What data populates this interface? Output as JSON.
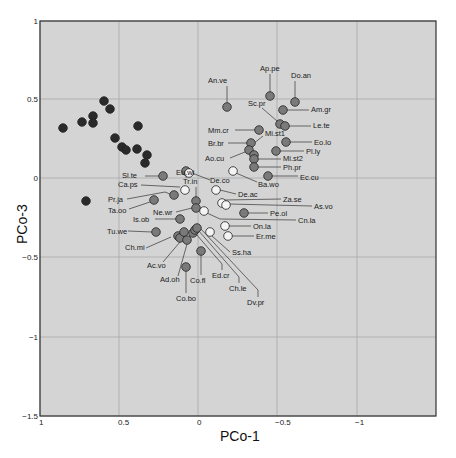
{
  "chart_data": {
    "type": "scatter",
    "title": "",
    "xlabel": "PCo-1",
    "ylabel": "PCo-3",
    "xlim": [
      1,
      -1.5
    ],
    "ylim": [
      -1.5,
      1
    ],
    "x_reversed": true,
    "grid": true,
    "x_ticks": [
      "1",
      "0.5",
      "0",
      "-0.5",
      "-1"
    ],
    "y_ticks": [
      "1",
      "0.5",
      "0",
      "-0.5",
      "-1",
      "-1.5"
    ],
    "colors": {
      "dark": "#2a2a2a",
      "mid": "#7a7a7a",
      "white": "#f4f4f4",
      "plot_bg": "#d4d4d4",
      "grid": "#a8a8a8"
    },
    "series": [
      {
        "name": "dark group",
        "color": "dark",
        "points": [
          {
            "x": 0.85,
            "y": 0.33
          },
          {
            "x": 0.73,
            "y": 0.36
          },
          {
            "x": 0.66,
            "y": 0.4
          },
          {
            "x": 0.66,
            "y": 0.36
          },
          {
            "x": 0.59,
            "y": 0.5
          },
          {
            "x": 0.55,
            "y": 0.45
          },
          {
            "x": 0.52,
            "y": 0.26
          },
          {
            "x": 0.48,
            "y": 0.2
          },
          {
            "x": 0.45,
            "y": 0.18
          },
          {
            "x": 0.38,
            "y": 0.34
          },
          {
            "x": 0.38,
            "y": 0.19
          },
          {
            "x": 0.32,
            "y": 0.15
          },
          {
            "x": 0.33,
            "y": 0.1
          },
          {
            "x": 0.71,
            "y": -0.14
          }
        ]
      },
      {
        "name": "labelled mid",
        "color": "mid",
        "points": [
          {
            "x": -0.18,
            "y": 0.45,
            "label": "An.ve"
          },
          {
            "x": -0.45,
            "y": 0.53,
            "label": "Ap.pe"
          },
          {
            "x": -0.6,
            "y": 0.48,
            "label": "Do.an"
          },
          {
            "x": -0.53,
            "y": 0.43,
            "label": "Am.gr"
          },
          {
            "x": -0.49,
            "y": 0.34,
            "label": "Sc.pr"
          },
          {
            "x": -0.53,
            "y": 0.33,
            "label": "Le.te"
          },
          {
            "x": -0.32,
            "y": 0.31,
            "label": "Mm.cr"
          },
          {
            "x": -0.38,
            "y": 0.27,
            "label": "Mi.st1"
          },
          {
            "x": -0.56,
            "y": 0.24,
            "label": "Eo.lo"
          },
          {
            "x": -0.36,
            "y": 0.22,
            "label": "Br.br"
          },
          {
            "x": -0.35,
            "y": 0.19,
            "label": "Ao.cu"
          },
          {
            "x": -0.49,
            "y": 0.17,
            "label": "Pl.ly"
          },
          {
            "x": -0.38,
            "y": 0.14,
            "label": "Mi.st2"
          },
          {
            "x": -0.38,
            "y": 0.1,
            "label": "Ph.pr"
          },
          {
            "x": -0.45,
            "y": 0.01,
            "label": "Ec.cu"
          },
          {
            "x": 0.11,
            "y": 0.05,
            "label": "Eu.wi"
          },
          {
            "x": 0.22,
            "y": -0.01,
            "label": "Sl.te"
          },
          {
            "x": 0.24,
            "y": -0.12,
            "label": "Pr.ja"
          },
          {
            "x": 0.37,
            "y": -0.17,
            "label": "Ta.oo"
          },
          {
            "x": 0.02,
            "y": -0.19,
            "label": "Tr.in"
          },
          {
            "x": 0.03,
            "y": -0.23,
            "label": "Ne.wr"
          },
          {
            "x": 0.11,
            "y": -0.28,
            "label": "Is.ob"
          },
          {
            "x": 0.27,
            "y": -0.36,
            "label": "Tu.we"
          },
          {
            "x": 0.07,
            "y": -0.31,
            "label": "Ch.mi"
          },
          {
            "x": 0.13,
            "y": -0.35,
            "label": "Ac.vo"
          },
          {
            "x": 0.09,
            "y": -0.38,
            "label": "Ad.oh"
          },
          {
            "x": -0.02,
            "y": -0.42,
            "label": "Co.fl"
          },
          {
            "x": 0.08,
            "y": -0.55,
            "label": "Co.bo"
          },
          {
            "x": -0.29,
            "y": -0.23,
            "label": "Pe.ol"
          },
          {
            "x": 0.13,
            "y": -0.32,
            "label": ""
          },
          {
            "x": 0.1,
            "y": -0.32,
            "label": ""
          },
          {
            "x": 0.05,
            "y": -0.3,
            "label": ""
          },
          {
            "x": 0.08,
            "y": -0.3,
            "label": ""
          },
          {
            "x": 0.03,
            "y": -0.29,
            "label": ""
          }
        ]
      },
      {
        "name": "labelled white",
        "color": "white",
        "points": [
          {
            "x": 0.08,
            "y": -0.04,
            "label": "Ca.ps"
          },
          {
            "x": -0.03,
            "y": 0.04,
            "label": "De.co"
          },
          {
            "x": -0.11,
            "y": -0.08,
            "label": "De.ac"
          },
          {
            "x": -0.2,
            "y": -0.17,
            "label": "Za.se"
          },
          {
            "x": -0.24,
            "y": -0.19,
            "label": "As.vo"
          },
          {
            "x": -0.01,
            "y": -0.21,
            "label": "Cn.la"
          },
          {
            "x": -0.18,
            "y": -0.32,
            "label": "On.la"
          },
          {
            "x": -0.2,
            "y": -0.38,
            "label": "Er.me"
          },
          {
            "x": -0.12,
            "y": -0.32,
            "label": "Ss.ha"
          },
          {
            "x": 0.03,
            "y": -0.37,
            "label": "Ed.cr"
          },
          {
            "x": 0.01,
            "y": -0.37,
            "label": "Ch.le"
          },
          {
            "x": -0.02,
            "y": -0.36,
            "label": "Dv.pr"
          },
          {
            "x": -0.23,
            "y": 0.04,
            "label": "Ba.wo"
          }
        ]
      }
    ]
  },
  "axes": {
    "x_label": "PCo-1",
    "y_label": "PCo-3",
    "x_ticks": [
      "1",
      "0.5",
      "0",
      "-0.5",
      "-1"
    ],
    "y_ticks": [
      "1",
      "0.5",
      "0",
      "-0.5",
      "-1",
      "-1.5"
    ]
  },
  "labels": [
    {
      "text": "An.ve",
      "tx": 208,
      "ty": 83,
      "px": 227,
      "py": 107,
      "path": "M227,103 L227,86"
    },
    {
      "text": "Ap.pe",
      "tx": 260,
      "ty": 71,
      "px": 270,
      "py": 96,
      "path": "M270,92 L270,74"
    },
    {
      "text": "Do.an",
      "tx": 291,
      "ty": 78,
      "px": 295,
      "py": 102,
      "path": "M295,98 L295,81"
    },
    {
      "text": "Am.gr",
      "tx": 311,
      "ty": 112,
      "px": 283,
      "py": 110,
      "path": "M287,110 L309,110"
    },
    {
      "text": "Sc.pr",
      "tx": 248,
      "ty": 106,
      "px": 280,
      "py": 124,
      "path": "M262,108 L277,121"
    },
    {
      "text": "Le.te",
      "tx": 313,
      "ty": 128,
      "px": 285,
      "py": 126,
      "path": "M289,126 L311,126"
    },
    {
      "text": "Mm.cr",
      "tx": 208,
      "ty": 133,
      "px": 259,
      "py": 130,
      "path": "M235,130 L255,130"
    },
    {
      "text": "Mi.st1",
      "tx": 265,
      "ty": 136,
      "px": 251,
      "py": 144,
      "path": "M263,136 L253,144"
    },
    {
      "text": "Eo.lo",
      "tx": 314,
      "ty": 145,
      "px": 286,
      "py": 142,
      "path": "M290,142 L312,142"
    },
    {
      "text": "Br.br",
      "tx": 208,
      "ty": 146,
      "px": 251,
      "py": 143,
      "path": "M228,143 L247,143"
    },
    {
      "text": "Ao.cu",
      "tx": 205,
      "ty": 161,
      "px": 249,
      "py": 152,
      "path": "M230,158 L245,152"
    },
    {
      "text": "Pl.ly",
      "tx": 306,
      "ty": 154,
      "px": 276,
      "py": 151,
      "path": "M280,151 L304,151"
    },
    {
      "text": "Mi.st2",
      "tx": 283,
      "ty": 161,
      "px": 254,
      "py": 159,
      "path": "M258,159 L281,159"
    },
    {
      "text": "Ph.pr",
      "tx": 283,
      "ty": 170,
      "px": 254,
      "py": 167,
      "path": "M258,167 L281,167"
    },
    {
      "text": "Ec.cu",
      "tx": 300,
      "ty": 180,
      "px": 268,
      "py": 176,
      "path": "M272,176 L298,176"
    },
    {
      "text": "Ba.wo",
      "tx": 258,
      "ty": 187,
      "px": 233,
      "py": 171,
      "path": "M236,173 L257,182"
    },
    {
      "text": "Eu.wi",
      "tx": 176,
      "ty": 175,
      "px": 186,
      "py": 171,
      "path": "M186,167 L186,178"
    },
    {
      "text": "De.co",
      "tx": 210,
      "ty": 183,
      "px": 189,
      "py": 173,
      "path": "M192,173 L210,180"
    },
    {
      "text": "Tr.in",
      "tx": 183,
      "ty": 184,
      "px": 196,
      "py": 201,
      "path": "M196,187 L196,197"
    },
    {
      "text": "De.ac",
      "tx": 238,
      "ty": 197,
      "px": 216,
      "py": 190,
      "path": "M220,190 L236,194"
    },
    {
      "text": "Za.se",
      "tx": 283,
      "ty": 202,
      "px": 222,
      "py": 203,
      "path": "M225,200 L281,199"
    },
    {
      "text": "As.vo",
      "tx": 314,
      "ty": 209,
      "px": 226,
      "py": 205,
      "path": "M229,204 L312,206"
    },
    {
      "text": "Pe.ol",
      "tx": 270,
      "ty": 216,
      "px": 244,
      "py": 213,
      "path": "M248,213 L268,213"
    },
    {
      "text": "Cn.la",
      "tx": 298,
      "ty": 223,
      "px": 204,
      "py": 211,
      "path": "M207,213 L220,219 L296,220"
    },
    {
      "text": "On.la",
      "tx": 253,
      "ty": 229,
      "px": 225,
      "py": 226,
      "path": "M229,226 L251,226"
    },
    {
      "text": "Er.me",
      "tx": 256,
      "ty": 239,
      "px": 228,
      "py": 236,
      "path": "M232,236 L254,236"
    },
    {
      "text": "Ss.ha",
      "tx": 232,
      "ty": 255,
      "px": 210,
      "py": 232,
      "path": "M212,236 L230,252"
    },
    {
      "text": "Sl.te",
      "tx": 122,
      "ty": 178,
      "px": 163,
      "py": 176,
      "path": "M145,176 L159,176"
    },
    {
      "text": "Ca.ps",
      "tx": 118,
      "ty": 187,
      "px": 185,
      "py": 190,
      "path": "M141,185 L180,187"
    },
    {
      "text": "Pr.ja",
      "tx": 108,
      "ty": 202,
      "px": 174,
      "py": 195,
      "path": "M127,199 L165,192 L170,194"
    },
    {
      "text": "Ta.oo",
      "tx": 108,
      "ty": 213,
      "px": 154,
      "py": 200,
      "path": "M129,209 L150,202"
    },
    {
      "text": "Ne.wr",
      "tx": 153,
      "ty": 215,
      "px": 196,
      "py": 208,
      "path": "M176,212 L192,208"
    },
    {
      "text": "Is.ob",
      "tx": 133,
      "ty": 222,
      "px": 180,
      "py": 219,
      "path": "M155,219 L176,219"
    },
    {
      "text": "Tu.we",
      "tx": 107,
      "ty": 234,
      "px": 156,
      "py": 232,
      "path": "M128,231 L152,232"
    },
    {
      "text": "Ch.mi",
      "tx": 125,
      "ty": 250,
      "px": 178,
      "py": 236,
      "path": "M146,248 L171,237"
    },
    {
      "text": "Ac.vo",
      "tx": 147,
      "ty": 268,
      "px": 180,
      "py": 238,
      "path": "M163,262 L180,242"
    },
    {
      "text": "Ad.oh",
      "tx": 160,
      "ty": 282,
      "px": 187,
      "py": 240,
      "path": "M178,276 L187,244"
    },
    {
      "text": "Co.fl",
      "tx": 190,
      "ty": 283,
      "px": 201,
      "py": 251,
      "path": "M201,255 L201,275"
    },
    {
      "text": "Co.bo",
      "tx": 176,
      "ty": 301,
      "px": 186,
      "py": 267,
      "path": "M186,271 L186,293"
    },
    {
      "text": "Ed.cr",
      "tx": 212,
      "ty": 278,
      "px": 193,
      "py": 233,
      "path": "M196,234 L222,264 L222,270"
    },
    {
      "text": "Ch.le",
      "tx": 229,
      "ty": 291,
      "px": 195,
      "py": 230,
      "path": "M198,230 L239,277 L239,283"
    },
    {
      "text": "Dv.pr",
      "tx": 247,
      "ty": 305,
      "px": 197,
      "py": 228,
      "path": "M200,228 L258,290 L258,297"
    }
  ],
  "unlabeled_points": {
    "dark": [
      [
        63,
        128
      ],
      [
        82,
        122
      ],
      [
        93,
        116
      ],
      [
        93,
        123
      ],
      [
        104,
        101
      ],
      [
        110,
        109
      ],
      [
        115,
        138
      ],
      [
        122,
        147
      ],
      [
        126,
        150
      ],
      [
        138,
        126
      ],
      [
        137,
        149
      ],
      [
        147,
        155
      ],
      [
        145,
        163
      ],
      [
        86,
        201
      ]
    ],
    "mid": [
      [
        227,
        107
      ],
      [
        270,
        96
      ],
      [
        295,
        102
      ],
      [
        283,
        110
      ],
      [
        280,
        124
      ],
      [
        285,
        126
      ],
      [
        259,
        130
      ],
      [
        251,
        143
      ],
      [
        286,
        142
      ],
      [
        249,
        150
      ],
      [
        276,
        151
      ],
      [
        254,
        155
      ],
      [
        254,
        159
      ],
      [
        254,
        167
      ],
      [
        268,
        176
      ],
      [
        186,
        171
      ],
      [
        163,
        176
      ],
      [
        174,
        195
      ],
      [
        154,
        200
      ],
      [
        196,
        201
      ],
      [
        196,
        208
      ],
      [
        180,
        219
      ],
      [
        156,
        232
      ],
      [
        178,
        236
      ],
      [
        180,
        238
      ],
      [
        187,
        240
      ],
      [
        193,
        233
      ],
      [
        195,
        230
      ],
      [
        197,
        228
      ],
      [
        186,
        267
      ],
      [
        201,
        251
      ],
      [
        244,
        213
      ],
      [
        184,
        232
      ]
    ],
    "white": [
      [
        189,
        173
      ],
      [
        185,
        190
      ],
      [
        233,
        171
      ],
      [
        216,
        190
      ],
      [
        222,
        203
      ],
      [
        226,
        205
      ],
      [
        204,
        211
      ],
      [
        225,
        226
      ],
      [
        228,
        236
      ],
      [
        210,
        232
      ]
    ]
  }
}
